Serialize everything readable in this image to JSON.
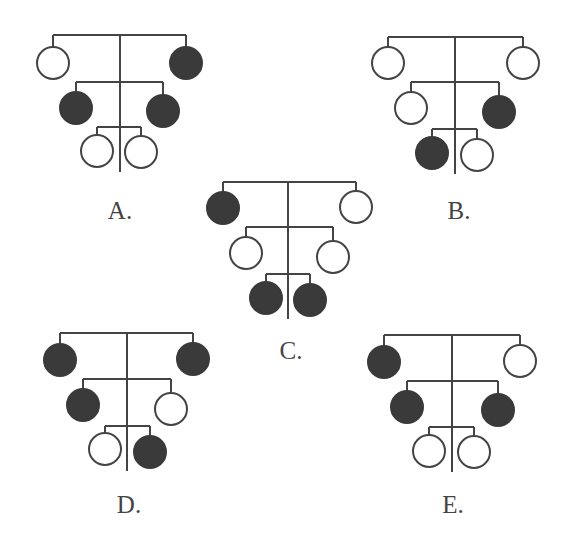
{
  "figure": {
    "width": 576,
    "height": 551,
    "line_color": "#444444",
    "fill_color": "#3a3a3a",
    "open_fill": "#ffffff",
    "line_width": 2,
    "circle_radius": 16
  },
  "pedigrees": [
    {
      "label": "A.",
      "label_pos": [
        120,
        210
      ],
      "trunk": {
        "x": 120,
        "y1": 35,
        "y2": 172
      },
      "generations": [
        {
          "y": 35,
          "left": {
            "x": 53,
            "cy": 63,
            "affected": false
          },
          "right": {
            "x": 186,
            "cy": 63,
            "affected": true
          }
        },
        {
          "y": 82,
          "left": {
            "x": 76,
            "cy": 108,
            "affected": true
          },
          "right": {
            "x": 163,
            "cy": 111,
            "affected": true
          }
        },
        {
          "y": 127,
          "left": {
            "x": 97,
            "cy": 151,
            "affected": false
          },
          "right": {
            "x": 141,
            "cy": 152,
            "affected": false
          }
        }
      ]
    },
    {
      "label": "B.",
      "label_pos": [
        459,
        210
      ],
      "trunk": {
        "x": 455,
        "y1": 37,
        "y2": 174
      },
      "generations": [
        {
          "y": 37,
          "left": {
            "x": 388,
            "cy": 63,
            "affected": false
          },
          "right": {
            "x": 523,
            "cy": 63,
            "affected": false
          }
        },
        {
          "y": 82,
          "left": {
            "x": 411,
            "cy": 108,
            "affected": false
          },
          "right": {
            "x": 499,
            "cy": 112,
            "affected": true
          }
        },
        {
          "y": 129,
          "left": {
            "x": 432,
            "cy": 153,
            "affected": true
          },
          "right": {
            "x": 477,
            "cy": 155,
            "affected": false
          }
        }
      ]
    },
    {
      "label": "C.",
      "label_pos": [
        291,
        350
      ],
      "trunk": {
        "x": 288,
        "y1": 182,
        "y2": 319
      },
      "generations": [
        {
          "y": 182,
          "left": {
            "x": 223,
            "cy": 208,
            "affected": true
          },
          "right": {
            "x": 356,
            "cy": 207,
            "affected": false
          }
        },
        {
          "y": 227,
          "left": {
            "x": 246,
            "cy": 253,
            "affected": false
          },
          "right": {
            "x": 333,
            "cy": 257,
            "affected": false
          }
        },
        {
          "y": 274,
          "left": {
            "x": 266,
            "cy": 298,
            "affected": true
          },
          "right": {
            "x": 310,
            "cy": 300,
            "affected": true
          }
        }
      ]
    },
    {
      "label": "D.",
      "label_pos": [
        129,
        504
      ],
      "trunk": {
        "x": 127,
        "y1": 333,
        "y2": 471
      },
      "generations": [
        {
          "y": 333,
          "left": {
            "x": 60,
            "cy": 360,
            "affected": true
          },
          "right": {
            "x": 193,
            "cy": 359,
            "affected": true
          }
        },
        {
          "y": 379,
          "left": {
            "x": 83,
            "cy": 405,
            "affected": true
          },
          "right": {
            "x": 171,
            "cy": 409,
            "affected": false
          }
        },
        {
          "y": 426,
          "left": {
            "x": 105,
            "cy": 449,
            "affected": false
          },
          "right": {
            "x": 150,
            "cy": 452,
            "affected": true
          }
        }
      ]
    },
    {
      "label": "E.",
      "label_pos": [
        453,
        504
      ],
      "trunk": {
        "x": 452,
        "y1": 335,
        "y2": 472
      },
      "generations": [
        {
          "y": 335,
          "left": {
            "x": 384,
            "cy": 362,
            "affected": true
          },
          "right": {
            "x": 520,
            "cy": 361,
            "affected": false
          }
        },
        {
          "y": 381,
          "left": {
            "x": 407,
            "cy": 407,
            "affected": true
          },
          "right": {
            "x": 498,
            "cy": 410,
            "affected": true
          }
        },
        {
          "y": 427,
          "left": {
            "x": 429,
            "cy": 451,
            "affected": false
          },
          "right": {
            "x": 474,
            "cy": 452,
            "affected": false
          }
        }
      ]
    }
  ]
}
